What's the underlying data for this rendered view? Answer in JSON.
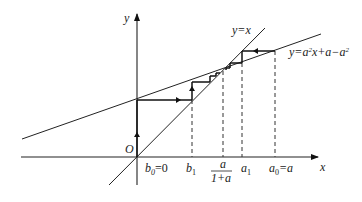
{
  "diagram": {
    "type": "cobweb-iteration-plot",
    "colors": {
      "stroke": "#222222",
      "background": "#ffffff"
    },
    "origin_px": [
      137,
      157
    ],
    "axes": {
      "x_label": "x",
      "y_label": "y",
      "origin_label": "O"
    },
    "curves": [
      {
        "name": "identity",
        "label": "y=x"
      },
      {
        "name": "affine",
        "label_parts": [
          "y=a",
          "2",
          "x+a−a",
          "2"
        ]
      }
    ],
    "x_tick_labels": {
      "b0": {
        "base": "b",
        "sub": "0",
        "rest": "=0"
      },
      "b1": {
        "base": "b",
        "sub": "1"
      },
      "fixed": {
        "num": "a",
        "den": "1+a"
      },
      "a1": {
        "base": "a",
        "sub": "1"
      },
      "a0": {
        "base": "a",
        "sub": "0",
        "rest": "=a"
      }
    }
  }
}
